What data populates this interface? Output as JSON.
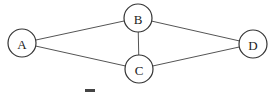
{
  "diagram": {
    "type": "undirected-graph",
    "nodes": [
      {
        "id": "A",
        "label": "A",
        "cx": 22,
        "cy": 43,
        "r": 14
      },
      {
        "id": "B",
        "label": "B",
        "cx": 138,
        "cy": 18,
        "r": 14
      },
      {
        "id": "C",
        "label": "C",
        "cx": 139,
        "cy": 69,
        "r": 14
      },
      {
        "id": "D",
        "label": "D",
        "cx": 253,
        "cy": 44,
        "r": 14
      }
    ],
    "edges": [
      {
        "from": "A",
        "to": "B"
      },
      {
        "from": "A",
        "to": "C"
      },
      {
        "from": "B",
        "to": "C"
      },
      {
        "from": "B",
        "to": "D"
      },
      {
        "from": "C",
        "to": "D"
      }
    ]
  }
}
